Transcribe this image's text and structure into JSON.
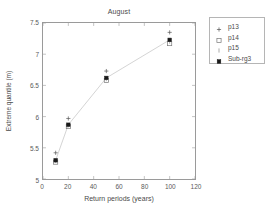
{
  "chart_data": {
    "type": "scatter",
    "title": "August",
    "xlabel": "Return periods (years)",
    "ylabel": "Extreme quantile (m)",
    "xlim": [
      0,
      120
    ],
    "ylim": [
      5,
      7.5
    ],
    "xticks": [
      0,
      20,
      40,
      60,
      80,
      100,
      120
    ],
    "yticks": [
      5,
      5.5,
      6,
      6.5,
      7,
      7.5
    ],
    "xticklabels": [
      "0",
      "20",
      "40",
      "60",
      "80",
      "100",
      "120"
    ],
    "yticklabels": [
      "5",
      "5.5",
      "6",
      "6.5",
      "7",
      "7.5"
    ],
    "grid": false,
    "legend_position": "outside right top",
    "x": [
      10,
      20,
      50,
      100
    ],
    "series": [
      {
        "name": "p13",
        "marker": "plus",
        "color": "#555555",
        "values": [
          5.42,
          5.97,
          6.73,
          7.35
        ]
      },
      {
        "name": "p14",
        "marker": "square-open",
        "color": "#777777",
        "values": [
          5.27,
          5.84,
          6.58,
          7.17
        ]
      },
      {
        "name": "p15",
        "marker": "tick",
        "color": "#888888",
        "values": [
          5.29,
          5.86,
          6.6,
          7.2
        ]
      },
      {
        "name": "Sub-rg3",
        "marker": "square-filled",
        "color": "#1a1a1a",
        "line": true,
        "values": [
          5.3,
          5.87,
          6.62,
          7.23
        ]
      }
    ]
  },
  "legend": {
    "entries": [
      {
        "label": "p13"
      },
      {
        "label": "p14"
      },
      {
        "label": "p15"
      },
      {
        "label": "Sub-rg3"
      }
    ]
  }
}
